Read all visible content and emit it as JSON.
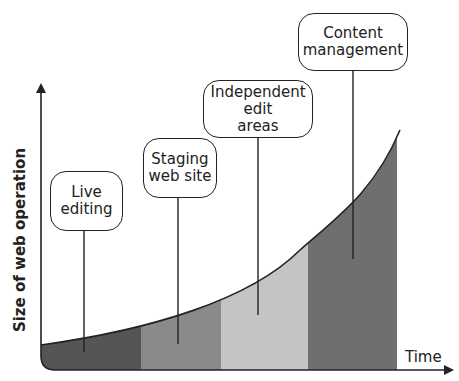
{
  "diagram": {
    "y_axis_label": "Size of web operation",
    "x_axis_label": "Time",
    "stages": [
      {
        "label": "Live editing",
        "band_color": "#555555"
      },
      {
        "label": "Staging web site",
        "band_color": "#8a8a8a"
      },
      {
        "label": "Independent edit areas",
        "band_color": "#c4c4c4"
      },
      {
        "label": "Content management",
        "band_color": "#6f6f6f"
      }
    ],
    "callouts": {
      "live": "Live\nediting",
      "staging": "Staging\nweb site",
      "independent": "Independent\nedit\nareas",
      "content": "Content\nmanagement"
    },
    "curve": "exponential growth",
    "colors": {
      "line": "#222222",
      "background": "#ffffff"
    }
  }
}
